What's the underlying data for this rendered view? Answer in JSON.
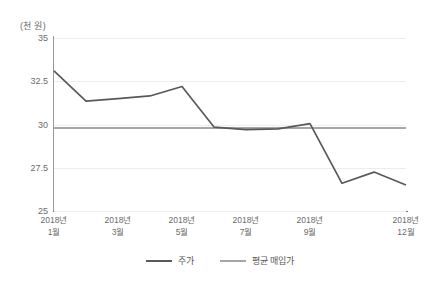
{
  "chart_data": {
    "type": "line",
    "title": "",
    "subtitle": "",
    "xlabel": "",
    "ylabel": "(천 원)",
    "ylim": [
      25,
      35
    ],
    "yticks": [
      35,
      32.5,
      30,
      27.5,
      25
    ],
    "ytick_labels": [
      "35",
      "32.5",
      "30",
      "27.5",
      "25"
    ],
    "grid": true,
    "grid_axis": "y",
    "legend_position": "bottom",
    "x_tick_positions": [
      0,
      2,
      4,
      6,
      8,
      11
    ],
    "xtick_labels": [
      {
        "year": "2018년",
        "month": "1월"
      },
      {
        "year": "2018년",
        "month": "3월"
      },
      {
        "year": "2018년",
        "month": "5월"
      },
      {
        "year": "2018년",
        "month": "7월"
      },
      {
        "year": "2018년",
        "month": "9월"
      },
      {
        "year": "2018년",
        "month": "12월"
      }
    ],
    "x": [
      0,
      1,
      2,
      3,
      4,
      5,
      6,
      7,
      8,
      9,
      10,
      11
    ],
    "series": [
      {
        "name": "주가",
        "color": "#595959",
        "values": [
          33.1,
          31.35,
          31.5,
          31.65,
          32.2,
          29.85,
          29.7,
          29.75,
          30.05,
          26.6,
          27.25,
          26.5
        ]
      },
      {
        "name": "평균 매입가",
        "color": "#a6a6a6",
        "values": [
          29.8,
          29.8,
          29.8,
          29.8,
          29.8,
          29.8,
          29.8,
          29.8,
          29.8,
          29.8,
          29.8,
          29.8
        ]
      }
    ]
  },
  "legend": {
    "items": [
      {
        "label": "주가",
        "color": "#595959"
      },
      {
        "label": "평균 매입가",
        "color": "#a6a6a6"
      }
    ]
  },
  "colors": {
    "stock_line": "#595959",
    "average_line": "#a6a6a6",
    "gridline": "#ededed",
    "axis": "#6e6e6e",
    "text": "#6b6b6b",
    "background": "#ffffff"
  }
}
